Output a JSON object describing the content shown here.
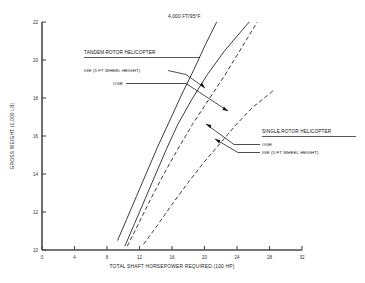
{
  "chart_data": {
    "type": "line",
    "title": "4,000 FT/95°F",
    "xlabel": "TOTAL SHAFT HORSEPOWER REQUIRED (100 HP)",
    "ylabel": "GROSS WEIGHT (1,000 LB)",
    "xlim": [
      0,
      32
    ],
    "ylim": [
      10,
      22
    ],
    "xticks": [
      "0",
      "4",
      "8",
      "12",
      "16",
      "20",
      "24",
      "28",
      "32"
    ],
    "yticks": [
      "10",
      "12",
      "14",
      "16",
      "18",
      "20",
      "22"
    ],
    "grid": false,
    "legend_position": "in-plot annotations with leader lines",
    "series": [
      {
        "name": "TANDEM ROTOR HELICOPTER IGE (5 FT WHEEL HEIGHT)",
        "style": "solid",
        "points": [
          [
            9.3,
            10.5
          ],
          [
            10.4,
            11.6
          ],
          [
            11.6,
            12.8
          ],
          [
            12.9,
            14.1
          ],
          [
            14.2,
            15.4
          ],
          [
            15.6,
            16.7
          ],
          [
            17.1,
            18.1
          ],
          [
            18.7,
            19.5
          ],
          [
            20.1,
            20.8
          ],
          [
            21.5,
            22.0
          ]
        ]
      },
      {
        "name": "TANDEM ROTOR HELICOPTER OGE",
        "style": "solid",
        "points": [
          [
            10.2,
            10.2
          ],
          [
            11.4,
            11.4
          ],
          [
            12.7,
            12.7
          ],
          [
            14.0,
            14.0
          ],
          [
            15.3,
            15.3
          ],
          [
            16.7,
            16.6
          ],
          [
            18.4,
            17.9
          ],
          [
            20.3,
            19.2
          ],
          [
            22.5,
            20.5
          ],
          [
            25.5,
            22.0
          ]
        ]
      },
      {
        "name": "SINGLE ROTOR HELICOPTER OGE",
        "style": "dashed",
        "points": [
          [
            10.5,
            10.2
          ],
          [
            11.9,
            11.4
          ],
          [
            13.4,
            12.7
          ],
          [
            15.0,
            14.0
          ],
          [
            16.7,
            15.3
          ],
          [
            18.5,
            16.6
          ],
          [
            20.5,
            17.9
          ],
          [
            22.5,
            19.2
          ],
          [
            24.5,
            20.6
          ],
          [
            26.5,
            22.0
          ]
        ]
      },
      {
        "name": "SINGLE ROTOR HELICOPTER IGE (5 FT WHEEL HEIGHT)",
        "style": "dashed",
        "points": [
          [
            12.5,
            10.3
          ],
          [
            14.2,
            11.3
          ],
          [
            16.0,
            12.4
          ],
          [
            17.9,
            13.5
          ],
          [
            19.9,
            14.6
          ],
          [
            21.9,
            15.6
          ],
          [
            23.9,
            16.6
          ],
          [
            25.9,
            17.5
          ],
          [
            28.5,
            18.4
          ]
        ]
      }
    ],
    "annotations": {
      "tandem_header": "TANDEM ROTOR HELICOPTER",
      "tandem_ige": "IGE (5 FT WHEEL HEIGHT)",
      "tandem_oge": "OGE",
      "single_header": "SINGLE ROTOR HELICOPTER",
      "single_oge": "OGE",
      "single_ige": "IGE (5-FT WHEEL HEIGHT)"
    }
  }
}
